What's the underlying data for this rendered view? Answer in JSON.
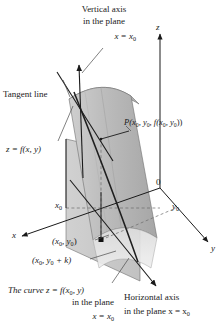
{
  "figure": {
    "type": "3d-calculus-diagram",
    "background": "#ffffff",
    "ink": "#1a1a1a"
  },
  "axes": {
    "z_label": "z",
    "y_label": "y",
    "x_label": "x",
    "origin_label": "0",
    "x0_tick": "x",
    "x0_tick_sub": "0",
    "y0_tick": "y",
    "y0_tick_sub": "0"
  },
  "annotations": {
    "vertical_axis": {
      "line1": "Vertical axis",
      "line2": "in the plane",
      "line3_var": "x = x",
      "line3_sub": "0"
    },
    "tangent_line": "Tangent line",
    "surface": {
      "text": "z = f(x, y)"
    },
    "point_P": {
      "text": "P(x",
      "sub1": "0",
      "mid": ", y",
      "sub2": "0",
      "mid2": ", f(x",
      "sub3": "0",
      "mid3": ", y",
      "sub4": "0",
      "tail": "))"
    },
    "base_point": {
      "open": "(x",
      "sub1": "0",
      "mid": ", y",
      "sub2": "0",
      "close": ")"
    },
    "offset_point": {
      "open": "(x",
      "sub1": "0",
      "mid": ", y",
      "sub2": "0",
      "close": " + k)"
    },
    "curve": {
      "line1a": "The curve z = f(x",
      "line1sub": "0",
      "line1b": ", y)",
      "line2": "in the plane",
      "line3a": "x = x",
      "line3sub": "0"
    },
    "horizontal_axis": {
      "line1": "Horizontal axis",
      "line2a": "in the plane x = x",
      "line2sub": "0"
    }
  },
  "colors": {
    "surface_light": "#d9d9d9",
    "surface_mid": "#b9b9b9",
    "surface_dark": "#9a9a9a",
    "plane_fill": "#c6c6c6",
    "plane_pale": "#e6e6e6",
    "line": "#1a1a1a",
    "leader": "#555555"
  }
}
